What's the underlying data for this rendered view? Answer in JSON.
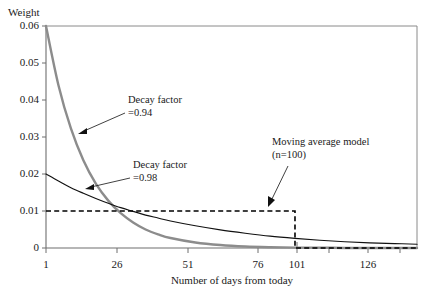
{
  "chart_data": {
    "type": "line",
    "title": "",
    "xlabel": "Number of days from today",
    "ylabel": "Weight",
    "xlim": [
      1,
      150
    ],
    "ylim": [
      0,
      0.06
    ],
    "grid": false,
    "legend": "none",
    "x_ticks": [
      "1",
      "26",
      "51",
      "76",
      "101",
      "126"
    ],
    "x_tick_values": [
      1,
      26,
      51,
      76,
      101,
      126
    ],
    "y_ticks": [
      "0",
      "0.01",
      "0.02",
      "0.03",
      "0.04",
      "0.05",
      "0.06"
    ],
    "y_tick_values": [
      0,
      0.01,
      0.02,
      0.03,
      0.04,
      0.05,
      0.06
    ],
    "series": [
      {
        "name": "Decay factor =0.94",
        "color": "#8c8c8c",
        "style": "solid",
        "initial_weight": 0.06,
        "decay_factor": 0.94,
        "x": [
          1,
          6,
          11,
          16,
          21,
          26,
          31,
          36,
          41,
          46,
          51,
          61,
          71,
          81,
          91,
          101,
          111,
          121,
          131,
          141,
          150
        ],
        "values": [
          0.06,
          0.044,
          0.0323,
          0.0237,
          0.0174,
          0.0128,
          0.0094,
          0.0069,
          0.005,
          0.0037,
          0.0027,
          0.0015,
          0.0008,
          0.0004,
          0.0002,
          0.0001,
          0.0001,
          0.0,
          0.0,
          0.0,
          0.0
        ]
      },
      {
        "name": "Decay factor =0.98",
        "color": "#111111",
        "style": "solid",
        "initial_weight": 0.02,
        "decay_factor": 0.98,
        "x": [
          1,
          6,
          11,
          16,
          21,
          26,
          31,
          36,
          41,
          46,
          51,
          61,
          71,
          81,
          91,
          101,
          111,
          121,
          131,
          141,
          150
        ],
        "values": [
          0.02,
          0.0181,
          0.0163,
          0.0148,
          0.0134,
          0.0121,
          0.0109,
          0.0099,
          0.0089,
          0.0081,
          0.0073,
          0.006,
          0.0049,
          0.004,
          0.0032,
          0.0026,
          0.0021,
          0.0017,
          0.0014,
          0.0012,
          0.001
        ]
      },
      {
        "name": "Moving average model (n=100)",
        "color": "#000000",
        "style": "dashed",
        "window": 100,
        "x": [
          1,
          101,
          101,
          150
        ],
        "values": [
          0.01,
          0.01,
          0.0,
          0.0
        ]
      }
    ],
    "annotations": [
      {
        "id": "decay-094",
        "line1": "Decay factor",
        "line2": "=0.94"
      },
      {
        "id": "decay-098",
        "line1": "Decay factor",
        "line2": "=0.98"
      },
      {
        "id": "moving-average",
        "line1": "Moving average model",
        "line2": "(n=100)"
      }
    ]
  }
}
